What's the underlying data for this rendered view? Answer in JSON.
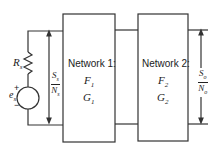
{
  "source": {
    "resistor_label": "R",
    "resistor_sub": "s",
    "voltage_label": "e",
    "voltage_sub": "s",
    "plus": "+",
    "minus": "−"
  },
  "input_ratio": {
    "num": "S",
    "num_sub": "s",
    "den": "N",
    "den_sub": "s"
  },
  "network1": {
    "title": "Network 1:",
    "f": "F",
    "f_sub": "1",
    "g": "G",
    "g_sub": "1"
  },
  "network2": {
    "title": "Network 2:",
    "f": "F",
    "f_sub": "2",
    "g": "G",
    "g_sub": "2"
  },
  "output_ratio": {
    "num": "S",
    "num_sub": "o",
    "den": "N",
    "den_sub": "o"
  }
}
